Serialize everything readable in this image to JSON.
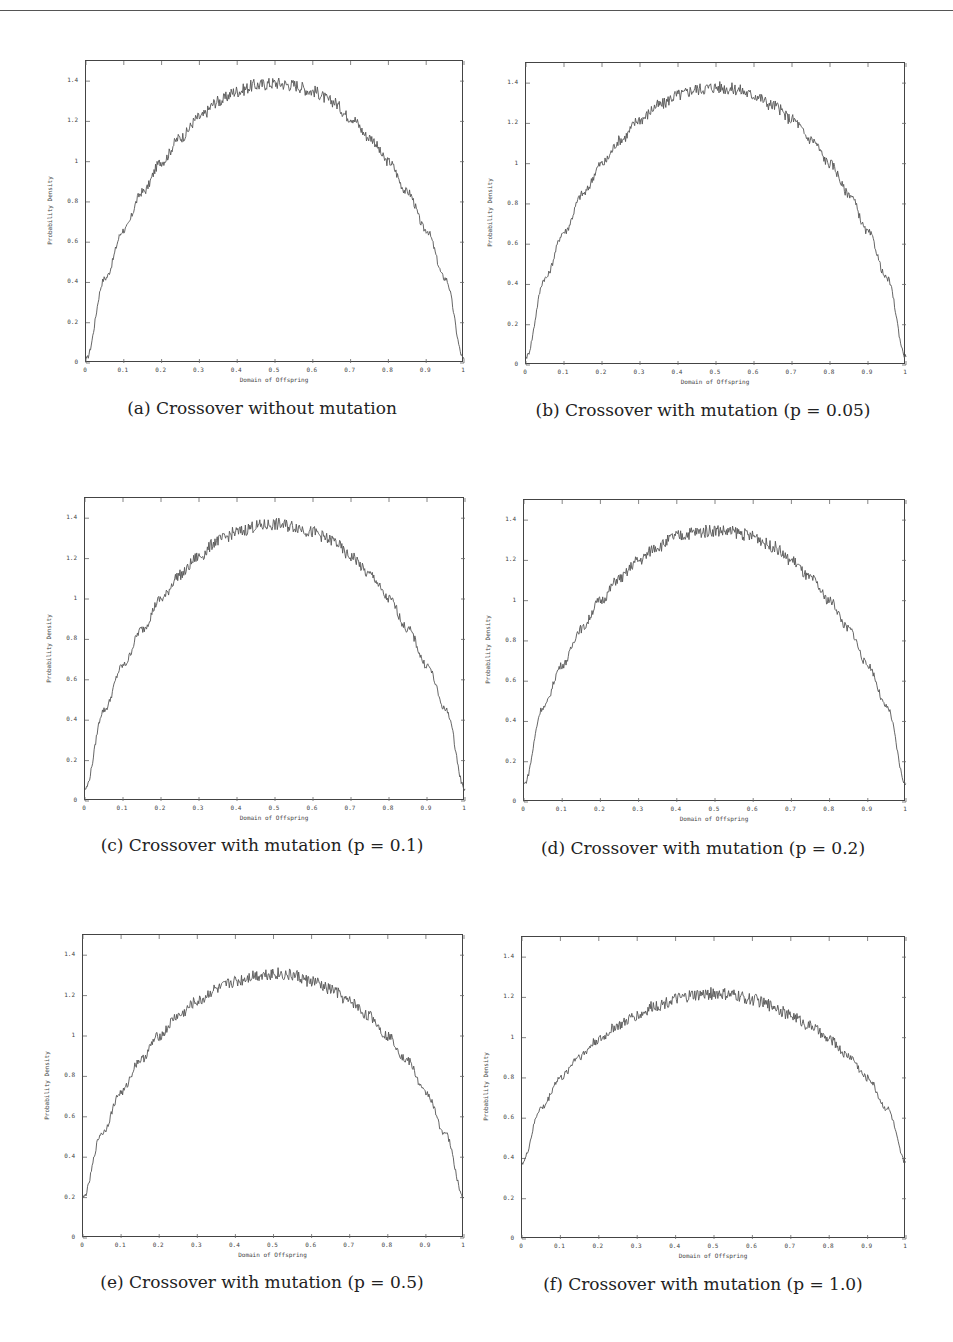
{
  "page": {
    "header_rule": true
  },
  "axes_common": {
    "xlabel": "Domain of Offspring",
    "ylabel": "Probability Density",
    "x_ticks": [
      "0",
      "0.1",
      "0.2",
      "0.3",
      "0.4",
      "0.5",
      "0.6",
      "0.7",
      "0.8",
      "0.9",
      "1"
    ],
    "y_ticks": [
      "0",
      "0.2",
      "0.4",
      "0.6",
      "0.8",
      "1",
      "1.2",
      "1.4"
    ]
  },
  "panels": [
    {
      "id": "a",
      "caption": "(a)  Crossover without mutation"
    },
    {
      "id": "b",
      "caption": "(b)  Crossover with mutation (p = 0.05)"
    },
    {
      "id": "c",
      "caption": "(c)  Crossover with mutation (p = 0.1)"
    },
    {
      "id": "d",
      "caption": "(d)  Crossover with mutation (p = 0.2)"
    },
    {
      "id": "e",
      "caption": "(e)  Crossover with mutation (p = 0.5)"
    },
    {
      "id": "f",
      "caption": "(f)  Crossover with mutation (p = 1.0)"
    }
  ],
  "chart_data": [
    {
      "type": "line",
      "title": "(a) Crossover without mutation",
      "xlabel": "Domain of Offspring",
      "ylabel": "Probability Density",
      "xlim": [
        0,
        1
      ],
      "ylim": [
        0,
        1.5
      ],
      "grid": false,
      "x": [
        0,
        0.05,
        0.1,
        0.15,
        0.2,
        0.25,
        0.3,
        0.35,
        0.4,
        0.45,
        0.5,
        0.55,
        0.6,
        0.65,
        0.7,
        0.75,
        0.8,
        0.85,
        0.9,
        0.95,
        1
      ],
      "series": [
        {
          "name": "density",
          "values": [
            0.02,
            0.42,
            0.66,
            0.85,
            1.0,
            1.12,
            1.22,
            1.3,
            1.35,
            1.38,
            1.39,
            1.38,
            1.35,
            1.3,
            1.22,
            1.12,
            1.0,
            0.85,
            0.66,
            0.42,
            0.02
          ]
        }
      ]
    },
    {
      "type": "line",
      "title": "(b) Crossover with mutation (p = 0.05)",
      "xlabel": "Domain of Offspring",
      "ylabel": "Probability Density",
      "xlim": [
        0,
        1
      ],
      "ylim": [
        0,
        1.5
      ],
      "grid": false,
      "x": [
        0,
        0.05,
        0.1,
        0.15,
        0.2,
        0.25,
        0.3,
        0.35,
        0.4,
        0.45,
        0.5,
        0.55,
        0.6,
        0.65,
        0.7,
        0.75,
        0.8,
        0.85,
        0.9,
        0.95,
        1
      ],
      "series": [
        {
          "name": "density",
          "values": [
            0.04,
            0.43,
            0.66,
            0.85,
            1.0,
            1.12,
            1.22,
            1.29,
            1.34,
            1.37,
            1.38,
            1.37,
            1.34,
            1.29,
            1.22,
            1.12,
            1.0,
            0.85,
            0.66,
            0.43,
            0.04
          ]
        }
      ]
    },
    {
      "type": "line",
      "title": "(c) Crossover with mutation (p = 0.1)",
      "xlabel": "Domain of Offspring",
      "ylabel": "Probability Density",
      "xlim": [
        0,
        1
      ],
      "ylim": [
        0,
        1.5
      ],
      "grid": false,
      "x": [
        0,
        0.05,
        0.1,
        0.15,
        0.2,
        0.25,
        0.3,
        0.35,
        0.4,
        0.45,
        0.5,
        0.55,
        0.6,
        0.65,
        0.7,
        0.75,
        0.8,
        0.85,
        0.9,
        0.95,
        1
      ],
      "series": [
        {
          "name": "density",
          "values": [
            0.06,
            0.45,
            0.67,
            0.85,
            1.0,
            1.12,
            1.21,
            1.29,
            1.33,
            1.36,
            1.37,
            1.36,
            1.33,
            1.29,
            1.21,
            1.12,
            1.0,
            0.85,
            0.67,
            0.45,
            0.06
          ]
        }
      ]
    },
    {
      "type": "line",
      "title": "(d) Crossover with mutation (p = 0.2)",
      "xlabel": "Domain of Offspring",
      "ylabel": "Probability Density",
      "xlim": [
        0,
        1
      ],
      "ylim": [
        0,
        1.5
      ],
      "grid": false,
      "x": [
        0,
        0.05,
        0.1,
        0.15,
        0.2,
        0.25,
        0.3,
        0.35,
        0.4,
        0.45,
        0.5,
        0.55,
        0.6,
        0.65,
        0.7,
        0.75,
        0.8,
        0.85,
        0.9,
        0.95,
        1
      ],
      "series": [
        {
          "name": "density",
          "values": [
            0.09,
            0.47,
            0.68,
            0.86,
            1.0,
            1.11,
            1.2,
            1.27,
            1.32,
            1.34,
            1.35,
            1.34,
            1.32,
            1.27,
            1.2,
            1.11,
            1.0,
            0.86,
            0.68,
            0.47,
            0.09
          ]
        }
      ]
    },
    {
      "type": "line",
      "title": "(e) Crossover with mutation (p = 0.5)",
      "xlabel": "Domain of Offspring",
      "ylabel": "Probability Density",
      "xlim": [
        0,
        1
      ],
      "ylim": [
        0,
        1.5
      ],
      "grid": false,
      "x": [
        0,
        0.05,
        0.1,
        0.15,
        0.2,
        0.25,
        0.3,
        0.35,
        0.4,
        0.45,
        0.5,
        0.55,
        0.6,
        0.65,
        0.7,
        0.75,
        0.8,
        0.85,
        0.9,
        0.95,
        1
      ],
      "series": [
        {
          "name": "density",
          "values": [
            0.2,
            0.52,
            0.72,
            0.88,
            1.0,
            1.1,
            1.17,
            1.23,
            1.27,
            1.3,
            1.31,
            1.3,
            1.27,
            1.23,
            1.17,
            1.1,
            1.0,
            0.88,
            0.72,
            0.52,
            0.2
          ]
        }
      ]
    },
    {
      "type": "line",
      "title": "(f) Crossover with mutation (p = 1.0)",
      "xlabel": "Domain of Offspring",
      "ylabel": "Probability Density",
      "xlim": [
        0,
        1
      ],
      "ylim": [
        0,
        1.5
      ],
      "grid": false,
      "x": [
        0,
        0.05,
        0.1,
        0.15,
        0.2,
        0.25,
        0.3,
        0.35,
        0.4,
        0.45,
        0.5,
        0.55,
        0.6,
        0.65,
        0.7,
        0.75,
        0.8,
        0.85,
        0.9,
        0.95,
        1
      ],
      "series": [
        {
          "name": "density",
          "values": [
            0.38,
            0.65,
            0.8,
            0.91,
            0.99,
            1.06,
            1.11,
            1.16,
            1.19,
            1.21,
            1.22,
            1.21,
            1.19,
            1.16,
            1.11,
            1.06,
            0.99,
            0.91,
            0.8,
            0.65,
            0.38
          ]
        }
      ]
    }
  ]
}
